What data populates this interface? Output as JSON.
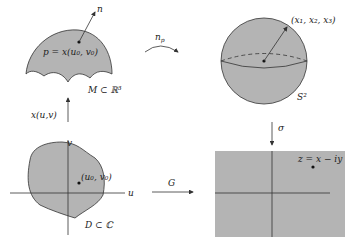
{
  "colors": {
    "fill": "#b4b4b4",
    "stroke": "#333333",
    "background": "#ffffff"
  },
  "surface": {
    "point_label": "p = x(u₀, v₀)",
    "normal_label": "n",
    "name": "M ⊂ ℝ³"
  },
  "sphere": {
    "point_label": "(x₁, x₂, x₃)",
    "name": "S²"
  },
  "domain": {
    "point_label": "(u₀, v₀)",
    "axis_u": "u",
    "axis_v": "v",
    "name": "D ⊂ ℂ"
  },
  "plane": {
    "point_label": "z = x − iy"
  },
  "maps": {
    "gauss": "n_p",
    "gauss_sub": "p",
    "gauss_main": "n",
    "param": "x(u,v)",
    "stereo": "σ",
    "composite": "G"
  }
}
